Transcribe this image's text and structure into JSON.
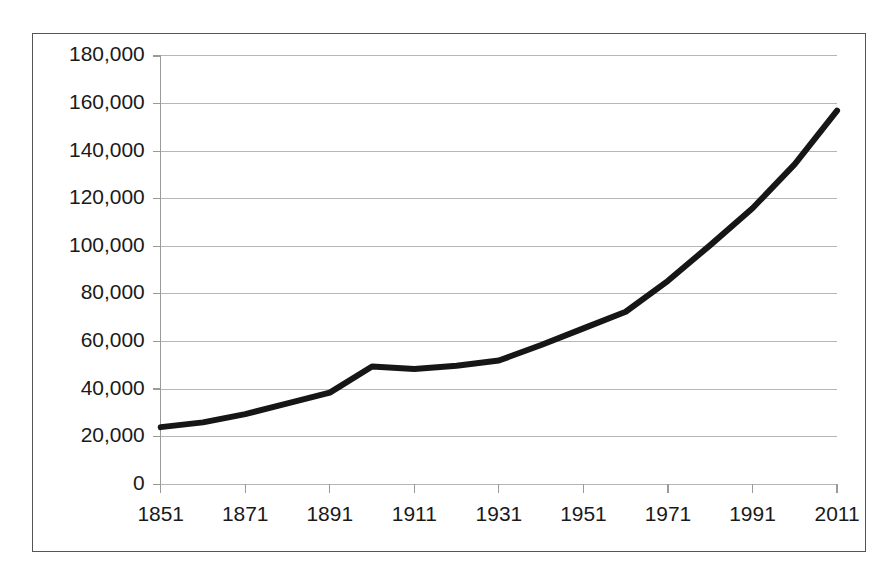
{
  "figure": {
    "frame_border_color": "#555555",
    "background_color": "#ffffff"
  },
  "chart_data": {
    "type": "line",
    "title": "",
    "subtitle": "",
    "xlabel": "",
    "ylabel": "",
    "grid": true,
    "legend": false,
    "legend_position": "none",
    "line_color": "#161616",
    "gridline_color": "#b6b6b6",
    "axis_color": "#9a9a9a",
    "xlim": [
      1851,
      2011
    ],
    "ylim": [
      0,
      180000
    ],
    "y_tick_labels": [
      "180,000",
      "160,000",
      "140,000",
      "120,000",
      "100,000",
      "80,000",
      "60,000",
      "40,000",
      "20,000",
      "0"
    ],
    "y_tick_values": [
      180000,
      160000,
      140000,
      120000,
      100000,
      80000,
      60000,
      40000,
      20000,
      0
    ],
    "x_tick_labels": [
      "1851",
      "1871",
      "1891",
      "1911",
      "1931",
      "1951",
      "1971",
      "1991",
      "2011"
    ],
    "x_tick_values": [
      1851,
      1871,
      1891,
      1911,
      1931,
      1951,
      1971,
      1991,
      2011
    ],
    "x": [
      1851,
      1861,
      1871,
      1881,
      1891,
      1901,
      1911,
      1921,
      1931,
      1941,
      1951,
      1961,
      1971,
      1981,
      1991,
      2001,
      2011
    ],
    "values": [
      24000,
      26000,
      29500,
      34000,
      38500,
      49500,
      48400,
      49800,
      52000,
      58500,
      65500,
      72500,
      85500,
      100500,
      116000,
      134500,
      157000
    ],
    "series": [
      {
        "name": "Population",
        "values": [
          24000,
          26000,
          29500,
          34000,
          38500,
          49500,
          48400,
          49800,
          52000,
          58500,
          65500,
          72500,
          85500,
          100500,
          116000,
          134500,
          157000
        ]
      }
    ]
  }
}
